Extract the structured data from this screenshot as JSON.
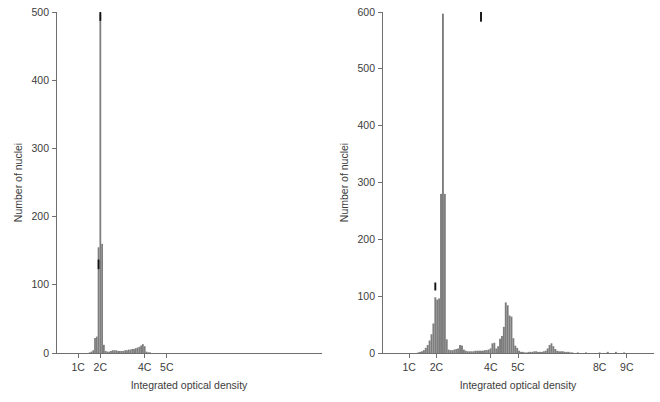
{
  "figure": {
    "panels": [
      "left",
      "right"
    ],
    "colors": {
      "bar": "#7d7d7d",
      "marker": "#121212",
      "axis": "#6f6f6f",
      "text": "#3c3c3c",
      "background": "#ffffff"
    }
  },
  "chart_data": [
    {
      "panel": "left",
      "type": "bar",
      "title": "",
      "xlabel": "Integrated optical density",
      "ylabel": "Number of nuclei",
      "ylim": [
        0,
        500
      ],
      "yticks": [
        0,
        100,
        200,
        300,
        400,
        500
      ],
      "yticklabels": [
        "0",
        "100",
        "200",
        "300",
        "400",
        "500"
      ],
      "xlim": [
        0.0,
        12.0
      ],
      "xticks": [
        1,
        2,
        4,
        5
      ],
      "xticklabels": [
        "1C",
        "2C",
        "4C",
        "5C"
      ],
      "grid": false,
      "legend": null,
      "xlabel_units": "C-value",
      "bin_width": 0.08,
      "x": [
        1.52,
        1.6,
        1.68,
        1.76,
        1.84,
        1.92,
        2.0,
        2.08,
        2.16,
        2.24,
        2.32,
        2.4,
        2.48,
        2.56,
        2.64,
        2.72,
        2.8,
        2.88,
        2.96,
        3.04,
        3.12,
        3.2,
        3.28,
        3.36,
        3.44,
        3.52,
        3.6,
        3.68,
        3.76,
        3.84,
        3.92,
        4.0,
        4.08,
        4.16,
        4.24,
        4.32,
        4.4
      ],
      "values": [
        1,
        2,
        4,
        22,
        24,
        155,
        498,
        160,
        12,
        3,
        2,
        2,
        3,
        4,
        4,
        4,
        3,
        3,
        3,
        3,
        4,
        4,
        5,
        5,
        6,
        6,
        7,
        8,
        9,
        11,
        13,
        10,
        2,
        1,
        1,
        0,
        0
      ],
      "markers": [
        {
          "x": 2.0,
          "y_from": 487,
          "y_to": 500,
          "color": "#121212",
          "note": "black cap at peak"
        },
        {
          "x": 1.92,
          "y_from": 123,
          "y_to": 137,
          "color": "#121212",
          "note": "black segment marker"
        }
      ],
      "annotations": []
    },
    {
      "panel": "right",
      "type": "bar",
      "title": "",
      "xlabel": "Integrated optical density",
      "ylabel": "Number of nuclei",
      "ylim": [
        0,
        600
      ],
      "yticks": [
        0,
        100,
        200,
        300,
        400,
        500,
        600
      ],
      "yticklabels": [
        "0",
        "100",
        "200",
        "300",
        "400",
        "500",
        "600"
      ],
      "xlim": [
        0.0,
        10.0
      ],
      "xticks": [
        1,
        2,
        4,
        5,
        8,
        9
      ],
      "xticklabels": [
        "1C",
        "2C",
        "4C",
        "5C",
        "8C",
        "9C"
      ],
      "grid": false,
      "legend": null,
      "xlabel_units": "C-value",
      "bin_width": 0.07,
      "x": [
        1.33,
        1.4,
        1.47,
        1.54,
        1.61,
        1.68,
        1.75,
        1.82,
        1.89,
        1.96,
        2.03,
        2.1,
        2.17,
        2.24,
        2.31,
        2.38,
        2.45,
        2.52,
        2.59,
        2.66,
        2.73,
        2.8,
        2.87,
        2.94,
        3.01,
        3.08,
        3.15,
        3.22,
        3.29,
        3.36,
        3.43,
        3.5,
        3.57,
        3.64,
        3.71,
        3.78,
        3.85,
        3.92,
        3.99,
        4.06,
        4.13,
        4.2,
        4.27,
        4.34,
        4.41,
        4.48,
        4.55,
        4.62,
        4.69,
        4.76,
        4.83,
        4.9,
        4.97,
        5.04,
        5.11,
        5.18,
        5.25,
        5.32,
        5.39,
        5.46,
        5.53,
        5.6,
        5.67,
        5.74,
        5.81,
        5.88,
        5.95,
        6.02,
        6.09,
        6.16,
        6.23,
        6.3,
        6.37,
        6.44,
        6.51,
        6.58,
        6.65,
        6.72,
        6.79,
        6.86,
        6.93,
        7.0,
        7.2,
        7.5,
        7.8,
        8.0,
        8.3,
        8.6,
        8.9
      ],
      "values": [
        1,
        2,
        3,
        5,
        9,
        14,
        22,
        33,
        52,
        98,
        94,
        96,
        280,
        597,
        280,
        24,
        6,
        5,
        5,
        6,
        7,
        8,
        14,
        13,
        6,
        4,
        3,
        3,
        3,
        3,
        4,
        4,
        4,
        4,
        4,
        5,
        5,
        6,
        8,
        17,
        18,
        8,
        12,
        25,
        30,
        46,
        89,
        84,
        66,
        64,
        26,
        13,
        9,
        4,
        2,
        2,
        1,
        1,
        2,
        2,
        2,
        3,
        3,
        2,
        2,
        2,
        3,
        4,
        8,
        14,
        17,
        12,
        7,
        4,
        3,
        3,
        3,
        2,
        2,
        2,
        1,
        1,
        1,
        1,
        0,
        1,
        2,
        2,
        1
      ],
      "markers": [
        {
          "x": 3.64,
          "y_from": 583,
          "y_to": 600,
          "color": "#121212",
          "note": "black cap at peak"
        },
        {
          "x": 1.96,
          "y_from": 110,
          "y_to": 124,
          "color": "#121212",
          "note": "black segment marker"
        }
      ],
      "annotations": []
    }
  ]
}
